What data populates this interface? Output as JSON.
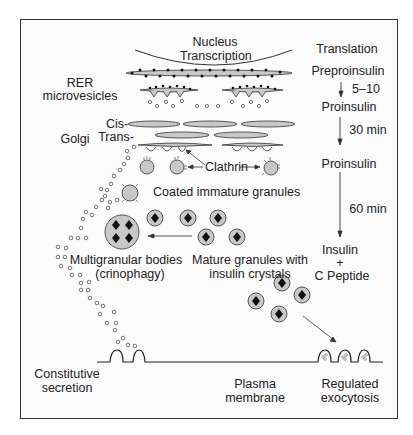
{
  "diagram": {
    "labels": {
      "nucleus": "Nucleus",
      "transcription": "Transcription",
      "translation": "Translation",
      "rer": "RER",
      "microvesicles": "microvesicles",
      "golgi": "Golgi",
      "cis": "Cis-",
      "trans": "Trans-",
      "clathrin": "Clathrin",
      "coated_immature_granules": "Coated immature granules",
      "multigranular_bodies": "Multigranular bodies",
      "crinophagy": "(crinophagy)",
      "mature_granules_line1": "Mature granules with",
      "mature_granules_line2": "insulin crystals",
      "constitutive_line1": "Constitutive",
      "constitutive_line2": "secretion",
      "plasma_line1": "Plasma",
      "plasma_line2": "membrane",
      "regulated_line1": "Regulated",
      "regulated_line2": "exocytosis"
    },
    "timeline": {
      "steps": [
        {
          "label": "Preproinsulin"
        },
        {
          "label": "Proinsulin"
        },
        {
          "label": "Proinsulin"
        },
        {
          "label": "Insulin"
        },
        {
          "label": "+"
        },
        {
          "label": "C Peptide"
        }
      ],
      "intervals": [
        "5–10",
        "30 min",
        "60 min"
      ]
    },
    "colors": {
      "organelle_fill": "#c8c8c8",
      "stroke": "#333333",
      "crystal": "#111111"
    }
  }
}
